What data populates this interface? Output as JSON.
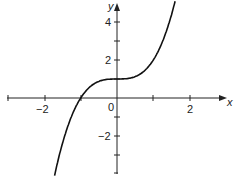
{
  "chart_data": {
    "type": "line",
    "title": "",
    "xlabel": "x",
    "ylabel": "y",
    "function": "y = x^3 + 1",
    "xlim": [
      -3,
      2.9
    ],
    "ylim": [
      -4,
      5
    ],
    "x_tick_labels": [
      "-2",
      "0",
      "2"
    ],
    "y_tick_labels": [
      "4",
      "2",
      "-2"
    ],
    "x_ticks": [
      -3,
      -2,
      -1,
      0,
      1,
      2
    ],
    "y_ticks": [
      4,
      3,
      2,
      1,
      -1,
      -2,
      -3,
      -4
    ],
    "grid": false,
    "series": [
      {
        "name": "curve",
        "x": [
          -1.8,
          -1.5,
          -1.0,
          -0.5,
          0,
          0.5,
          1.0,
          1.5,
          1.75
        ],
        "y": [
          -4.83,
          -2.38,
          0,
          0.88,
          1,
          1.13,
          2,
          4.38,
          6.36
        ]
      }
    ],
    "color": "#111111"
  },
  "labels": {
    "x_axis": "x",
    "y_axis": "y",
    "origin": "0",
    "xm2": "−2",
    "x2": "2",
    "y4": "4",
    "y2": "2",
    "ym2": "−2"
  }
}
